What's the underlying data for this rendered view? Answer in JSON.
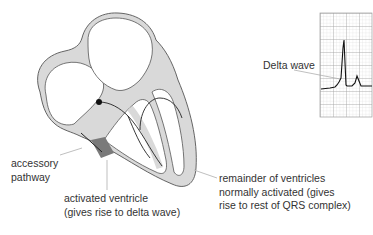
{
  "diagram": {
    "type": "anatomy-diagram",
    "colors": {
      "myocardium_fill": "#d9d9d9",
      "outline": "#555555",
      "activated_region": "#7a7a7a",
      "conduction_line": "#222222",
      "leader_line": "#b8b8b8",
      "ecg_grid": "#bdbdbd",
      "ecg_trace": "#111111"
    }
  },
  "labels": {
    "accessory_pathway": [
      "accessory",
      "pathway"
    ],
    "activated_ventricle": [
      "activated ventricle",
      "(gives rise to delta wave)"
    ],
    "remainder_ventricles": [
      "remainder of ventricles",
      "normally activated (gives",
      "rise to rest of QRS complex)"
    ],
    "delta_wave": "Delta wave"
  },
  "ecg_inset": {
    "grid": "small squares with major divisions",
    "features": [
      "baseline",
      "delta wave (slurred upstroke)",
      "tall R wave",
      "T wave"
    ]
  }
}
